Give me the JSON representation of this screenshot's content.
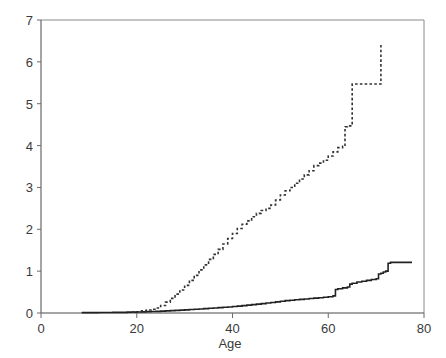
{
  "chart_data": {
    "type": "line",
    "title": "",
    "xlabel": "Age",
    "ylabel": "",
    "xlim": [
      0,
      80
    ],
    "ylim": [
      0,
      7
    ],
    "xticks": [
      0,
      20,
      40,
      60,
      80
    ],
    "yticks": [
      0,
      1,
      2,
      3,
      4,
      5,
      6,
      7
    ],
    "xtick_labels": [
      "0",
      "20",
      "40",
      "60",
      "80"
    ],
    "ytick_labels": [
      "0",
      "1",
      "2",
      "3",
      "4",
      "5",
      "6",
      "7"
    ],
    "grid": false,
    "legend": "none",
    "step_style": "post",
    "series": [
      {
        "name": "solid-curve",
        "linestyle": "solid",
        "color": "#222222",
        "x": [
          8.5,
          12,
          15,
          18,
          20,
          21,
          22,
          23,
          24,
          25,
          26,
          27,
          28,
          29,
          30,
          31,
          32,
          33,
          34,
          35,
          36,
          37,
          38,
          39,
          40,
          41,
          42,
          43,
          44,
          45,
          46,
          47,
          48,
          49,
          50,
          51,
          52,
          53,
          54,
          55,
          56,
          57,
          58,
          59,
          60,
          61,
          61.5,
          62,
          63,
          64,
          64.5,
          65,
          66,
          67,
          68,
          69,
          70,
          70.5,
          71,
          71.5,
          72,
          72.5,
          73,
          77.5
        ],
        "y": [
          0.01,
          0.012,
          0.015,
          0.02,
          0.025,
          0.028,
          0.032,
          0.036,
          0.04,
          0.045,
          0.05,
          0.056,
          0.062,
          0.068,
          0.075,
          0.082,
          0.089,
          0.096,
          0.104,
          0.112,
          0.12,
          0.128,
          0.136,
          0.145,
          0.155,
          0.165,
          0.176,
          0.188,
          0.2,
          0.212,
          0.225,
          0.238,
          0.252,
          0.266,
          0.28,
          0.295,
          0.305,
          0.315,
          0.325,
          0.335,
          0.345,
          0.355,
          0.365,
          0.375,
          0.39,
          0.41,
          0.56,
          0.58,
          0.6,
          0.62,
          0.69,
          0.71,
          0.74,
          0.76,
          0.78,
          0.8,
          0.82,
          0.93,
          0.95,
          0.98,
          1.0,
          1.19,
          1.21,
          1.21
        ]
      },
      {
        "name": "dashed-curve",
        "linestyle": "dashed",
        "color": "#333333",
        "x": [
          19,
          20,
          21,
          22,
          23,
          24,
          25,
          26,
          27,
          28,
          29,
          30,
          31,
          32,
          33,
          34,
          35,
          36,
          37,
          38,
          39,
          40,
          41,
          42,
          43,
          44,
          45,
          46,
          47,
          48,
          49,
          50,
          51,
          52,
          53,
          54,
          55,
          56,
          57,
          58,
          59,
          60,
          61,
          62,
          63,
          63.5,
          64,
          64.5,
          65,
          66,
          70.5,
          71
        ],
        "y": [
          0.02,
          0.03,
          0.05,
          0.07,
          0.09,
          0.12,
          0.18,
          0.26,
          0.35,
          0.45,
          0.55,
          0.66,
          0.78,
          0.9,
          1.03,
          1.15,
          1.28,
          1.4,
          1.52,
          1.65,
          1.78,
          1.9,
          2.02,
          2.12,
          2.2,
          2.3,
          2.38,
          2.45,
          2.5,
          2.58,
          2.7,
          2.82,
          2.92,
          3.0,
          3.1,
          3.2,
          3.3,
          3.4,
          3.52,
          3.58,
          3.65,
          3.75,
          3.85,
          3.95,
          3.98,
          4.45,
          4.47,
          4.47,
          5.47,
          5.47,
          5.47,
          6.4
        ]
      }
    ]
  }
}
